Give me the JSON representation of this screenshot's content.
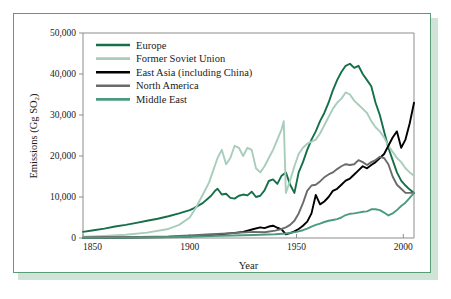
{
  "chart_data": {
    "type": "line",
    "title": "",
    "xlabel": "Year",
    "ylabel": "Emissions (Gg SO2)",
    "ylabel_display": "Emissions (Gg SO",
    "ylabel_sub": "2",
    "ylabel_tail": ")",
    "xlim": [
      1850,
      2005
    ],
    "ylim": [
      0,
      50000
    ],
    "xticks": [
      1850,
      1900,
      1950,
      2000
    ],
    "xtick_labels": [
      "1850",
      "1900",
      "1950",
      "2000"
    ],
    "yticks": [
      0,
      10000,
      20000,
      30000,
      40000,
      50000
    ],
    "ytick_labels": [
      "0",
      "10,000",
      "20,000",
      "30,000",
      "40,000",
      "50,000"
    ],
    "grid": false,
    "legend_position": "upper-left-inside",
    "series": [
      {
        "name": "Europe",
        "color": "#15704a",
        "x": [
          1850,
          1855,
          1860,
          1865,
          1870,
          1875,
          1880,
          1885,
          1890,
          1895,
          1900,
          1902,
          1904,
          1906,
          1908,
          1910,
          1912,
          1913,
          1915,
          1917,
          1919,
          1921,
          1923,
          1925,
          1927,
          1929,
          1931,
          1933,
          1935,
          1937,
          1939,
          1941,
          1943,
          1945,
          1947,
          1949,
          1951,
          1953,
          1955,
          1957,
          1959,
          1961,
          1963,
          1965,
          1967,
          1969,
          1971,
          1973,
          1975,
          1977,
          1979,
          1981,
          1983,
          1985,
          1987,
          1989,
          1991,
          1993,
          1995,
          1997,
          1999,
          2001,
          2003,
          2005
        ],
        "values": [
          1500,
          1900,
          2300,
          2800,
          3200,
          3700,
          4200,
          4700,
          5300,
          6000,
          6800,
          7300,
          7900,
          8500,
          9400,
          10300,
          11600,
          12000,
          10600,
          10800,
          9800,
          9600,
          10300,
          10600,
          10400,
          11300,
          10000,
          10300,
          11600,
          13900,
          14300,
          13200,
          15200,
          16000,
          13000,
          11000,
          16000,
          18500,
          21500,
          24000,
          26000,
          28500,
          30500,
          33000,
          36000,
          38500,
          40500,
          42000,
          42500,
          41500,
          42000,
          40000,
          38500,
          37000,
          33000,
          30000,
          26000,
          22000,
          19000,
          16000,
          14000,
          12800,
          11800,
          11000
        ]
      },
      {
        "name": "Former Soviet Union",
        "color": "#a8cdbb",
        "x": [
          1850,
          1860,
          1870,
          1880,
          1890,
          1895,
          1900,
          1903,
          1906,
          1909,
          1911,
          1913,
          1915,
          1917,
          1919,
          1921,
          1923,
          1925,
          1927,
          1929,
          1931,
          1933,
          1935,
          1937,
          1939,
          1941,
          1943,
          1944,
          1945,
          1947,
          1949,
          1951,
          1953,
          1955,
          1957,
          1959,
          1961,
          1963,
          1965,
          1967,
          1969,
          1971,
          1973,
          1975,
          1977,
          1979,
          1981,
          1983,
          1985,
          1987,
          1989,
          1991,
          1993,
          1995,
          1997,
          1999,
          2001,
          2003,
          2005
        ],
        "values": [
          300,
          500,
          800,
          1300,
          2200,
          3200,
          5000,
          7500,
          10500,
          13500,
          16500,
          19500,
          21500,
          18000,
          19500,
          22500,
          22000,
          20000,
          22000,
          21500,
          17000,
          16000,
          17500,
          19500,
          21500,
          24000,
          26500,
          28500,
          11000,
          14000,
          17500,
          20500,
          22000,
          23000,
          23500,
          24000,
          25500,
          27500,
          29500,
          31500,
          33000,
          34000,
          35500,
          35000,
          33500,
          32500,
          31500,
          30500,
          28500,
          27000,
          26000,
          24500,
          22500,
          21000,
          19500,
          18500,
          17000,
          16000,
          15200
        ]
      },
      {
        "name": "East Asia (including China)",
        "color": "#000000",
        "x": [
          1850,
          1870,
          1890,
          1900,
          1910,
          1920,
          1925,
          1930,
          1933,
          1935,
          1937,
          1939,
          1941,
          1943,
          1945,
          1947,
          1949,
          1951,
          1953,
          1955,
          1957,
          1959,
          1961,
          1963,
          1965,
          1967,
          1969,
          1971,
          1973,
          1975,
          1977,
          1979,
          1981,
          1983,
          1985,
          1987,
          1989,
          1991,
          1993,
          1995,
          1997,
          1999,
          2001,
          2003,
          2005
        ],
        "values": [
          60,
          120,
          250,
          400,
          700,
          1200,
          1500,
          2200,
          2600,
          2400,
          2800,
          3000,
          2500,
          2100,
          900,
          1200,
          1600,
          2200,
          3000,
          4000,
          6000,
          10500,
          8200,
          8900,
          10000,
          11500,
          12000,
          13000,
          14000,
          14500,
          15500,
          16500,
          17500,
          17000,
          17800,
          18500,
          19500,
          20500,
          22500,
          24500,
          26000,
          22000,
          24000,
          28000,
          33000
        ]
      },
      {
        "name": "North America",
        "color": "#6b6b6b",
        "x": [
          1850,
          1870,
          1890,
          1900,
          1910,
          1920,
          1930,
          1935,
          1940,
          1943,
          1945,
          1947,
          1949,
          1951,
          1953,
          1955,
          1957,
          1959,
          1961,
          1963,
          1965,
          1967,
          1969,
          1971,
          1973,
          1975,
          1977,
          1979,
          1981,
          1983,
          1985,
          1987,
          1989,
          1991,
          1993,
          1995,
          1997,
          1999,
          2001,
          2003,
          2005
        ],
        "values": [
          80,
          180,
          350,
          600,
          900,
          1200,
          1500,
          1400,
          1800,
          2200,
          2600,
          3200,
          4200,
          6000,
          8500,
          11500,
          12800,
          13000,
          13800,
          14800,
          15500,
          16000,
          16800,
          17500,
          18000,
          17800,
          18000,
          19000,
          18500,
          17800,
          18500,
          19000,
          19800,
          19500,
          18000,
          15000,
          13000,
          12000,
          11000,
          11000,
          11000
        ]
      },
      {
        "name": "Middle East",
        "color": "#4d9b7e",
        "x": [
          1850,
          1870,
          1890,
          1900,
          1910,
          1920,
          1930,
          1940,
          1945,
          1950,
          1953,
          1955,
          1957,
          1959,
          1961,
          1963,
          1965,
          1967,
          1969,
          1971,
          1973,
          1975,
          1977,
          1979,
          1981,
          1983,
          1985,
          1987,
          1989,
          1991,
          1993,
          1995,
          1997,
          1999,
          2001,
          2003,
          2005
        ],
        "values": [
          40,
          90,
          180,
          300,
          450,
          600,
          750,
          900,
          1100,
          1500,
          1900,
          2300,
          2800,
          3200,
          3500,
          3900,
          4200,
          4400,
          4600,
          5000,
          5600,
          5900,
          6000,
          6200,
          6400,
          6500,
          7000,
          7000,
          6800,
          6200,
          5500,
          6000,
          6800,
          7800,
          8600,
          9800,
          11000
        ]
      }
    ]
  },
  "legend": {
    "items": [
      {
        "label": "Europe"
      },
      {
        "label": "Former Soviet Union"
      },
      {
        "label": "East Asia (including China)"
      },
      {
        "label": "North America"
      },
      {
        "label": "Middle East"
      }
    ]
  },
  "colors": {
    "europe": "#15704a",
    "former_soviet_union": "#a8cdbb",
    "east_asia": "#000000",
    "north_america": "#6b6b6b",
    "middle_east": "#4d9b7e",
    "frame_border": "#5a9c77",
    "frame_shadow": "#cfe4d7",
    "axis": "#8d8d8d",
    "background": "#ffffff"
  }
}
